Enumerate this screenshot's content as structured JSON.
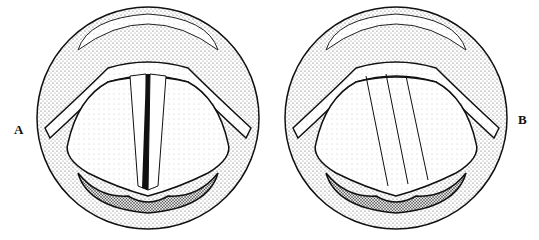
{
  "figure": {
    "panels": [
      {
        "label": "A",
        "state": "vocal folds closed (adducted) with slit"
      },
      {
        "label": "B",
        "state": "vocal folds slightly open"
      }
    ]
  }
}
